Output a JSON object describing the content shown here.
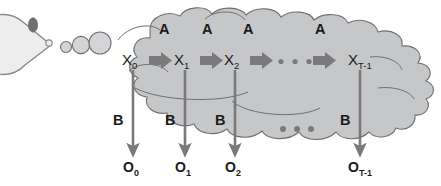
{
  "diagram": {
    "colors": {
      "cloud_fill": "#c6c7c9",
      "cloud_stroke": "#6e6f71",
      "bubble_fill": "#d3d4d6",
      "bubble_stroke": "#6e6f71",
      "agent_fill": "#ededed",
      "agent_stroke": "#8a8a8c",
      "eye_fill": "#6f6f71",
      "arrow_fill": "#7a7a7c",
      "emission_arrow": "#7a7a7c",
      "text": "#1a1a1a",
      "background": "#ffffff"
    },
    "agent": {
      "name": "pacman-thinker",
      "eye": "eye"
    },
    "thought_bubbles": [
      {
        "name": "thought-bubble-small",
        "cx": 66,
        "cy": 47,
        "r": 5.5
      },
      {
        "name": "thought-bubble-medium",
        "cx": 80,
        "cy": 46,
        "r": 8.5
      },
      {
        "name": "thought-bubble-large",
        "cx": 99,
        "cy": 44,
        "r": 11
      }
    ],
    "transition_label": "A",
    "emission_label": "B",
    "ellipsis_dots": 3,
    "states": [
      {
        "name": "state-x0",
        "base": "X",
        "sub": "0",
        "x": 131,
        "y": 64
      },
      {
        "name": "state-x1",
        "base": "X",
        "sub": "1",
        "x": 183,
        "y": 64
      },
      {
        "name": "state-x2",
        "base": "X",
        "sub": "2",
        "x": 233,
        "y": 64
      },
      {
        "name": "state-xt",
        "base": "X",
        "sub": "T-1",
        "x": 358,
        "y": 64
      }
    ],
    "observations": [
      {
        "name": "obs-o0",
        "base": "O",
        "sub": "0",
        "x": 131,
        "y": 168
      },
      {
        "name": "obs-o1",
        "base": "O",
        "sub": "1",
        "x": 183,
        "y": 168
      },
      {
        "name": "obs-o2",
        "base": "O",
        "sub": "2",
        "x": 233,
        "y": 168
      },
      {
        "name": "obs-ot",
        "base": "O",
        "sub": "T-1",
        "x": 358,
        "y": 168
      }
    ],
    "transition_arrows": [
      {
        "name": "transition-arrow-0",
        "x": 152,
        "y": 60
      },
      {
        "name": "transition-arrow-1",
        "x": 203,
        "y": 60
      },
      {
        "name": "transition-arrow-2",
        "x": 253,
        "y": 60
      },
      {
        "name": "transition-arrow-3",
        "x": 316,
        "y": 60
      }
    ],
    "transition_labels": [
      {
        "name": "transition-label-a0",
        "text": "A",
        "x": 164,
        "y": 29
      },
      {
        "name": "transition-label-a1",
        "text": "A",
        "x": 207,
        "y": 29
      },
      {
        "name": "transition-label-a2",
        "text": "A",
        "x": 248,
        "y": 29
      },
      {
        "name": "transition-label-a3",
        "text": "A",
        "x": 320,
        "y": 29
      }
    ],
    "emission_labels": [
      {
        "name": "emission-label-b0",
        "text": "B",
        "x": 116,
        "y": 120
      },
      {
        "name": "emission-label-b1",
        "text": "B",
        "x": 168,
        "y": 120
      },
      {
        "name": "emission-label-b2",
        "text": "B",
        "x": 218,
        "y": 120
      },
      {
        "name": "emission-label-b3",
        "text": "B",
        "x": 343,
        "y": 120
      }
    ],
    "emission_arrows": [
      {
        "name": "emission-arrow-0",
        "x": 133,
        "y1": 70,
        "y2": 153
      },
      {
        "name": "emission-arrow-1",
        "x": 185,
        "y1": 70,
        "y2": 153
      },
      {
        "name": "emission-arrow-2",
        "x": 235,
        "y1": 70,
        "y2": 153
      },
      {
        "name": "emission-arrow-3",
        "x": 360,
        "y1": 70,
        "y2": 153
      }
    ],
    "top_ellipsis": {
      "name": "state-ellipsis",
      "dots": [
        {
          "cx": 281,
          "cy": 62
        },
        {
          "cx": 295,
          "cy": 62
        },
        {
          "cx": 309,
          "cy": 62
        }
      ],
      "r": 2.6
    },
    "bottom_ellipsis": {
      "name": "observation-ellipsis",
      "dots": [
        {
          "cx": 283,
          "cy": 129
        },
        {
          "cx": 297,
          "cy": 129
        },
        {
          "cx": 311,
          "cy": 129
        }
      ],
      "r": 3.0
    }
  }
}
